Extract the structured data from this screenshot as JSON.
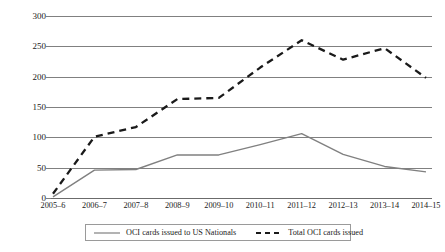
{
  "chart_data": {
    "type": "line",
    "title": "",
    "xlabel": "",
    "ylabel": "Thousands",
    "ylim": [
      0,
      300
    ],
    "ytick_labels": [
      "300",
      "250",
      "200",
      "150",
      "100",
      "50",
      "0"
    ],
    "ytick_values": [
      300,
      250,
      200,
      150,
      100,
      50,
      0
    ],
    "grid": true,
    "legend_position": "bottom",
    "categories": [
      "2005–6",
      "2006–7",
      "2007–8",
      "2008–9",
      "2009–10",
      "2010–11",
      "2011–12",
      "2012–13",
      "2013–14",
      "2014–15"
    ],
    "series": [
      {
        "name": "OCI cards issued to US Nationals",
        "style": "solid",
        "color": "#808080",
        "values": [
          2,
          46,
          47,
          71,
          71,
          88,
          106,
          72,
          52,
          43
        ]
      },
      {
        "name": "Total OCI cards issued",
        "style": "dashed",
        "color": "#1a1a1a",
        "values": [
          7,
          101,
          117,
          163,
          165,
          215,
          260,
          228,
          247,
          198
        ]
      }
    ]
  },
  "legend": {
    "entries": [
      {
        "label": "OCI cards issued to US Nationals",
        "style": "solid",
        "color": "#808080"
      },
      {
        "label": "Total OCI cards issued",
        "style": "dashed",
        "color": "#1a1a1a"
      }
    ]
  }
}
